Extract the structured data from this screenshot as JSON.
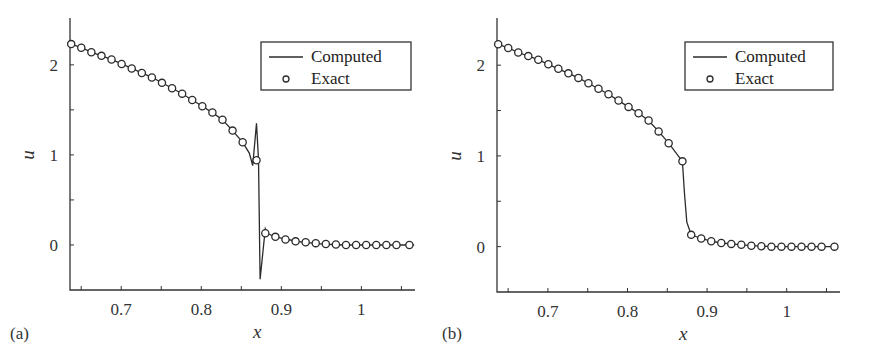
{
  "figure": {
    "panels": [
      {
        "id": "a",
        "label": "(a)"
      },
      {
        "id": "b",
        "label": "(b)"
      }
    ]
  },
  "legend": {
    "line_label": "Computed",
    "marker_label": "Exact"
  },
  "axes": {
    "xlabel": "x",
    "ylabel": "u",
    "xticks": [
      0.7,
      0.8,
      0.9,
      1
    ],
    "xtick_labels": [
      "0.7",
      "0.8",
      "0.9",
      "1"
    ],
    "xminor": [
      0.65,
      0.7,
      0.75,
      0.8,
      0.85,
      0.9,
      0.95,
      1.0,
      1.05
    ],
    "yticks": [
      0,
      1,
      2
    ],
    "ytick_labels": [
      "0",
      "1",
      "2"
    ],
    "yminor": [
      0,
      0.5,
      1,
      1.5,
      2
    ],
    "xlim": [
      0.636,
      1.067
    ],
    "ylim": [
      -0.5,
      2.52
    ]
  },
  "colors": {
    "line": "#2b2b2b",
    "marker_edge": "#2b2b2b",
    "marker_fill": "#ffffff",
    "axis": "#333333"
  },
  "chart_data": [
    {
      "type": "line",
      "panel": "(a)",
      "title": "",
      "xlabel": "x",
      "ylabel": "u",
      "xlim": [
        0.636,
        1.067
      ],
      "ylim": [
        -0.5,
        2.52
      ],
      "legend_position": "upper right",
      "grid": false,
      "series": [
        {
          "name": "Computed",
          "style": "line",
          "x": [
            0.6375,
            0.6501,
            0.6627,
            0.6753,
            0.6879,
            0.7005,
            0.7131,
            0.7257,
            0.7383,
            0.7509,
            0.7635,
            0.7761,
            0.7887,
            0.8013,
            0.8139,
            0.8265,
            0.8391,
            0.8517,
            0.86,
            0.8643,
            0.869,
            0.8715,
            0.8735,
            0.88,
            0.8825,
            0.8895,
            0.9021,
            0.9147,
            0.9273,
            0.9399,
            0.9525,
            0.9651,
            0.9777,
            0.9903,
            1.0029,
            1.0155,
            1.0281,
            1.0407,
            1.0533,
            1.0659
          ],
          "y": [
            2.23,
            2.19,
            2.14,
            2.1,
            2.06,
            2.01,
            1.96,
            1.91,
            1.86,
            1.8,
            1.74,
            1.68,
            1.61,
            1.54,
            1.47,
            1.39,
            1.27,
            1.14,
            1.02,
            0.88,
            1.35,
            0.95,
            -0.38,
            0.18,
            0.13,
            0.1,
            0.07,
            0.05,
            0.03,
            0.02,
            0.01,
            0.005,
            0.0,
            0.0,
            0.0,
            0.0,
            0.0,
            0.0,
            0.0,
            0.0
          ]
        },
        {
          "name": "Exact",
          "style": "marker",
          "x": [
            0.6375,
            0.6501,
            0.6627,
            0.6753,
            0.6879,
            0.7005,
            0.7131,
            0.7257,
            0.7383,
            0.7509,
            0.7635,
            0.7761,
            0.7887,
            0.8013,
            0.8139,
            0.8265,
            0.8391,
            0.8517,
            0.869,
            0.88,
            0.8926,
            0.9052,
            0.9178,
            0.9304,
            0.943,
            0.9556,
            0.9682,
            0.9808,
            0.9934,
            1.006,
            1.0186,
            1.0312,
            1.0438,
            1.06
          ],
          "y": [
            2.23,
            2.19,
            2.14,
            2.1,
            2.06,
            2.01,
            1.96,
            1.91,
            1.86,
            1.8,
            1.74,
            1.68,
            1.61,
            1.54,
            1.47,
            1.39,
            1.27,
            1.14,
            0.94,
            0.13,
            0.09,
            0.06,
            0.04,
            0.03,
            0.02,
            0.01,
            0.005,
            0.0,
            0.0,
            0.0,
            0.0,
            0.0,
            0.0,
            0.0
          ]
        }
      ]
    },
    {
      "type": "line",
      "panel": "(b)",
      "title": "",
      "xlabel": "x",
      "ylabel": "u",
      "xlim": [
        0.636,
        1.067
      ],
      "ylim": [
        -0.5,
        2.52
      ],
      "legend_position": "upper right",
      "grid": false,
      "series": [
        {
          "name": "Computed",
          "style": "line",
          "x": [
            0.6375,
            0.6501,
            0.6627,
            0.6753,
            0.6879,
            0.7005,
            0.7131,
            0.7257,
            0.7383,
            0.7509,
            0.7635,
            0.7761,
            0.7887,
            0.8013,
            0.8139,
            0.8265,
            0.8391,
            0.8517,
            0.869,
            0.8715,
            0.8745,
            0.88,
            0.8926,
            0.9052,
            0.9178,
            0.9304,
            0.943,
            0.9556,
            0.9682,
            0.9808,
            0.9934,
            1.006,
            1.0186,
            1.0312,
            1.0438,
            1.06
          ],
          "y": [
            2.23,
            2.19,
            2.14,
            2.1,
            2.06,
            2.01,
            1.96,
            1.91,
            1.86,
            1.8,
            1.74,
            1.68,
            1.61,
            1.54,
            1.47,
            1.39,
            1.27,
            1.14,
            0.94,
            0.6,
            0.27,
            0.13,
            0.09,
            0.06,
            0.04,
            0.03,
            0.02,
            0.01,
            0.005,
            0.0,
            0.0,
            0.0,
            0.0,
            0.0,
            0.0,
            0.0
          ]
        },
        {
          "name": "Exact",
          "style": "marker",
          "x": [
            0.6375,
            0.6501,
            0.6627,
            0.6753,
            0.6879,
            0.7005,
            0.7131,
            0.7257,
            0.7383,
            0.7509,
            0.7635,
            0.7761,
            0.7887,
            0.8013,
            0.8139,
            0.8265,
            0.8391,
            0.8517,
            0.869,
            0.88,
            0.8926,
            0.9052,
            0.9178,
            0.9304,
            0.943,
            0.9556,
            0.9682,
            0.9808,
            0.9934,
            1.006,
            1.0186,
            1.0312,
            1.0438,
            1.06
          ],
          "y": [
            2.23,
            2.19,
            2.14,
            2.1,
            2.06,
            2.01,
            1.96,
            1.91,
            1.86,
            1.8,
            1.74,
            1.68,
            1.61,
            1.54,
            1.47,
            1.39,
            1.27,
            1.14,
            0.94,
            0.13,
            0.09,
            0.06,
            0.04,
            0.03,
            0.02,
            0.01,
            0.005,
            0.0,
            0.0,
            0.0,
            0.0,
            0.0,
            0.0,
            0.0
          ]
        }
      ]
    }
  ]
}
